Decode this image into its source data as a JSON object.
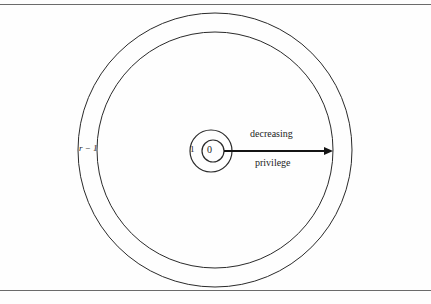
{
  "page": {
    "background_color": "#fefefe",
    "rule_color": "#6b6b6b",
    "stroke_color": "#1c1c1c",
    "partial_header_text": "",
    "top_rule_label": "horizontal-rule",
    "bottom_rule_label": "horizontal-rule"
  },
  "figure": {
    "type": "concentric-rings-diagram",
    "caption": "",
    "labels": {
      "outer_ring": "r − 1",
      "ring_one": "1",
      "ring_zero": "0",
      "arrow_line1": "decreasing",
      "arrow_line2": "privilege"
    },
    "circles": [
      {
        "name": "outermost-ring",
        "cx": 215,
        "cy": 150,
        "r": 137
      },
      {
        "name": "second-ring",
        "cx": 215,
        "cy": 150,
        "r": 118
      },
      {
        "name": "inner-ring-one",
        "cx": 211,
        "cy": 151,
        "r": 21
      },
      {
        "name": "inner-ring-zero",
        "cx": 213,
        "cy": 151,
        "r": 11
      }
    ],
    "arrow": {
      "name": "decreasing-privilege-arrow",
      "x1": 224,
      "y1": 151,
      "x2": 332,
      "y2": 151,
      "direction": "rightward"
    }
  }
}
